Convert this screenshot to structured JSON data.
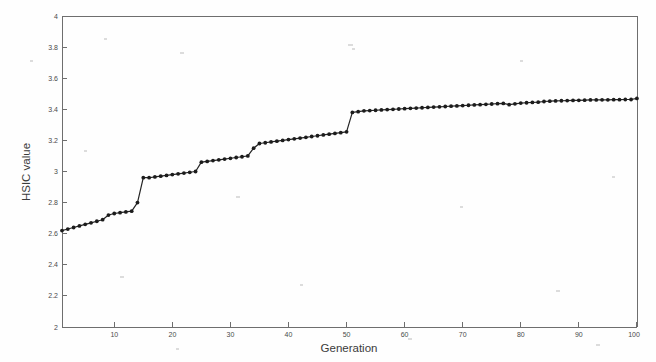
{
  "figure": {
    "background_color": "#fefefe",
    "axis_color": "#6e6e6e",
    "line_color": "#242424",
    "marker_color": "#1c1c1c"
  },
  "axes": {
    "xlabel": "Generation",
    "ylabel": "HSIC value",
    "x_ticks": [
      "10",
      "20",
      "30",
      "40",
      "50",
      "60",
      "70",
      "80",
      "90",
      "100"
    ],
    "y_ticks": [
      "2",
      "2.2",
      "2.4",
      "2.6",
      "2.8",
      "3",
      "3.2",
      "3.4",
      "3.6",
      "3.8",
      "4"
    ]
  },
  "chart_data": {
    "type": "line",
    "title": "",
    "xlabel": "Generation",
    "ylabel": "HSIC value",
    "xlim": [
      1,
      100
    ],
    "ylim": [
      2,
      4
    ],
    "x_ticks": [
      10,
      20,
      30,
      40,
      50,
      60,
      70,
      80,
      90,
      100
    ],
    "y_ticks": [
      2,
      2.2,
      2.4,
      2.6,
      2.8,
      3,
      3.2,
      3.4,
      3.6,
      3.8,
      4
    ],
    "grid": false,
    "legend": null,
    "markers": "filled-circle",
    "series": [
      {
        "name": "HSIC value",
        "x": [
          1,
          2,
          3,
          4,
          5,
          6,
          7,
          8,
          9,
          10,
          11,
          12,
          13,
          14,
          15,
          16,
          17,
          18,
          19,
          20,
          21,
          22,
          23,
          24,
          25,
          26,
          27,
          28,
          29,
          30,
          31,
          32,
          33,
          34,
          35,
          36,
          37,
          38,
          39,
          40,
          41,
          42,
          43,
          44,
          45,
          46,
          47,
          48,
          49,
          50,
          51,
          52,
          53,
          54,
          55,
          56,
          57,
          58,
          59,
          60,
          61,
          62,
          63,
          64,
          65,
          66,
          67,
          68,
          69,
          70,
          71,
          72,
          73,
          74,
          75,
          76,
          77,
          78,
          79,
          80,
          81,
          82,
          83,
          84,
          85,
          86,
          87,
          88,
          89,
          90,
          91,
          92,
          93,
          94,
          95,
          96,
          97,
          98,
          99,
          100
        ],
        "values": [
          2.62,
          2.63,
          2.64,
          2.65,
          2.66,
          2.67,
          2.68,
          2.69,
          2.72,
          2.73,
          2.735,
          2.74,
          2.745,
          2.8,
          2.96,
          2.96,
          2.965,
          2.97,
          2.975,
          2.98,
          2.985,
          2.99,
          2.995,
          3.0,
          3.06,
          3.065,
          3.07,
          3.075,
          3.08,
          3.085,
          3.09,
          3.095,
          3.1,
          3.15,
          3.18,
          3.185,
          3.19,
          3.195,
          3.2,
          3.205,
          3.21,
          3.215,
          3.22,
          3.225,
          3.23,
          3.235,
          3.24,
          3.245,
          3.25,
          3.255,
          3.38,
          3.385,
          3.39,
          3.392,
          3.394,
          3.396,
          3.398,
          3.4,
          3.402,
          3.404,
          3.406,
          3.408,
          3.41,
          3.412,
          3.414,
          3.416,
          3.418,
          3.42,
          3.422,
          3.424,
          3.426,
          3.428,
          3.43,
          3.432,
          3.434,
          3.436,
          3.438,
          3.43,
          3.435,
          3.44,
          3.442,
          3.444,
          3.446,
          3.45,
          3.452,
          3.454,
          3.455,
          3.456,
          3.457,
          3.458,
          3.459,
          3.46,
          3.46,
          3.461,
          3.461,
          3.462,
          3.462,
          3.463,
          3.463,
          3.47
        ]
      }
    ]
  }
}
